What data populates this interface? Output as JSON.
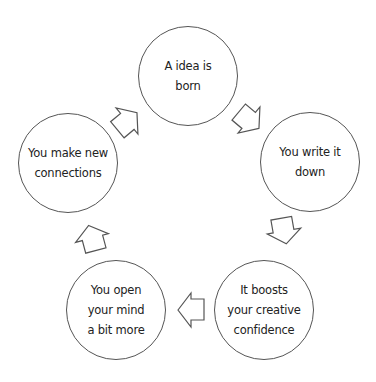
{
  "diagram": {
    "type": "cycle",
    "colors": {
      "stroke": "#555555",
      "text": "#222222",
      "background": "#ffffff"
    },
    "nodes": [
      {
        "id": "idea-born",
        "label": "A idea is\nborn",
        "cx": 188,
        "cy": 76
      },
      {
        "id": "write-down",
        "label": "You write it\ndown",
        "cx": 310,
        "cy": 162
      },
      {
        "id": "boost-confidence",
        "label": "It boosts\nyour creative\nconfidence",
        "cx": 264,
        "cy": 310
      },
      {
        "id": "open-mind",
        "label": "You open\nyour mind\na bit more",
        "cx": 116,
        "cy": 310
      },
      {
        "id": "new-connections",
        "label": "You make new\nconnections",
        "cx": 68,
        "cy": 163
      }
    ],
    "arrows": [
      {
        "from": "idea-born",
        "to": "write-down",
        "direction": "down-right"
      },
      {
        "from": "write-down",
        "to": "boost-confidence",
        "direction": "down"
      },
      {
        "from": "boost-confidence",
        "to": "open-mind",
        "direction": "left"
      },
      {
        "from": "open-mind",
        "to": "new-connections",
        "direction": "up"
      },
      {
        "from": "new-connections",
        "to": "idea-born",
        "direction": "up-right"
      }
    ]
  }
}
